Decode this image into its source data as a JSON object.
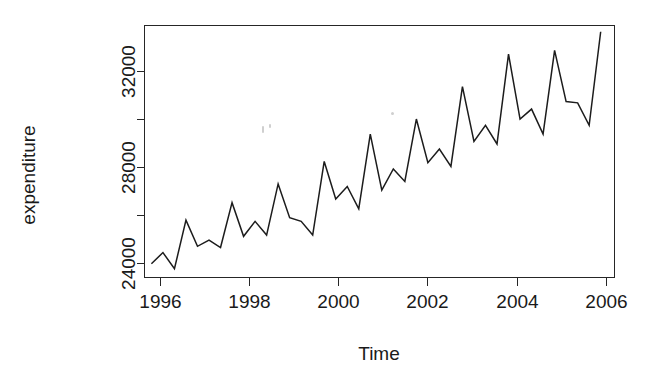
{
  "chart_data": {
    "type": "line",
    "title": "",
    "xlabel": "Time",
    "ylabel": "expenditure",
    "xlim": [
      1995.85,
      2006.05
    ],
    "ylim": [
      23450,
      33550
    ],
    "grid": false,
    "legend": "none",
    "x_ticks": [
      1996,
      1998,
      2000,
      2002,
      2004,
      2006
    ],
    "x_tick_labels": [
      "1996",
      "1998",
      "2000",
      "2002",
      "2004",
      "2006"
    ],
    "x_minor_ticks": [],
    "y_ticks": [
      24000,
      26000,
      28000,
      30000,
      32000
    ],
    "y_tick_labels": [
      "24000",
      "",
      "28000",
      "",
      "32000"
    ],
    "frequency": "quarterly",
    "series": [
      {
        "name": "expenditure",
        "color": "#1c1c1c",
        "x": [
          1996.0,
          1996.25,
          1996.5,
          1996.75,
          1997.0,
          1997.25,
          1997.5,
          1997.75,
          1998.0,
          1998.25,
          1998.5,
          1998.75,
          1999.0,
          1999.25,
          1999.5,
          1999.75,
          2000.0,
          2000.25,
          2000.5,
          2000.75,
          2001.0,
          2001.25,
          2001.5,
          2001.75,
          2002.0,
          2002.25,
          2002.5,
          2002.75,
          2003.0,
          2003.25,
          2003.5,
          2003.75,
          2004.0,
          2004.25,
          2004.5,
          2004.75,
          2005.0,
          2005.25,
          2005.5,
          2005.75
        ],
        "y": [
          24000,
          24450,
          23800,
          25750,
          24700,
          24950,
          24650,
          26450,
          25100,
          25700,
          25150,
          27200,
          25850,
          25700,
          25150,
          28100,
          26600,
          27100,
          26200,
          29200,
          26950,
          27800,
          27300,
          29800,
          28050,
          28600,
          27900,
          31100,
          28900,
          29550,
          28800,
          32400,
          29800,
          30200,
          29200,
          32550,
          30500,
          30450,
          29550,
          33300
        ]
      }
    ]
  },
  "axes": {
    "y_title": "expenditure",
    "x_title": "Time",
    "y_labels": [
      "32000",
      "28000",
      "24000"
    ],
    "x_labels": [
      "1996",
      "1998",
      "2000",
      "2002",
      "2004",
      "2006"
    ]
  }
}
